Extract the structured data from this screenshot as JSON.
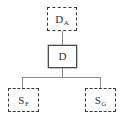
{
  "diagram": {
    "type": "tree",
    "title": "",
    "background_color": "#ffffff",
    "edge_color": "#8a8a8a",
    "nodes": [
      {
        "id": "DA",
        "base": "D",
        "subscript": "A",
        "border_style": "dashed",
        "border_color": "#3a3a3a",
        "role": "parent"
      },
      {
        "id": "D",
        "base": "D",
        "subscript": "",
        "border_style": "solid",
        "border_color": "#4a4a4a",
        "role": "root"
      },
      {
        "id": "SF",
        "base": "S",
        "subscript": "F",
        "border_style": "dashed",
        "border_color": "#3a3a3a",
        "role": "child"
      },
      {
        "id": "SG",
        "base": "S",
        "subscript": "G",
        "border_style": "dashed",
        "border_color": "#3a3a3a",
        "role": "child"
      }
    ],
    "edges": [
      {
        "from": "DA",
        "to": "D",
        "style": "solid"
      },
      {
        "from": "D",
        "to": "SF",
        "style": "solid"
      },
      {
        "from": "D",
        "to": "SG",
        "style": "solid"
      }
    ]
  }
}
